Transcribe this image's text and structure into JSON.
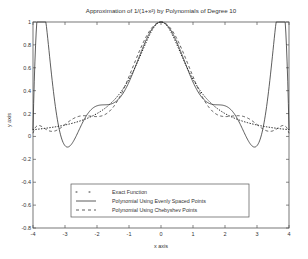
{
  "chart_data": {
    "type": "line",
    "title": "Approximation of 1/(1+x²) by Polynomials of Degree 10",
    "xlabel": "x axis",
    "ylabel": "y axis",
    "xlim": [
      -4,
      4
    ],
    "ylim": [
      -0.8,
      1
    ],
    "xticks": [
      -4,
      -3,
      -2,
      -1,
      0,
      1,
      2,
      3,
      4
    ],
    "yticks": [
      -0.8,
      -0.6,
      -0.4,
      -0.2,
      0,
      0.2,
      0.4,
      0.6,
      0.8,
      1
    ],
    "xtick_labels": [
      "-4",
      "-3",
      "-2",
      "-1",
      "0",
      "1",
      "2",
      "3",
      "4"
    ],
    "ytick_labels": [
      "-0.8",
      "-0.6",
      "-0.4",
      "-0.2",
      "0",
      "0.2",
      "0.4",
      "0.6",
      "0.8",
      "1"
    ],
    "grid": false,
    "legend_position": "lower center",
    "series": [
      {
        "name": "Exact Function",
        "style": "dotted",
        "function": "1/(1+x^2)",
        "x": [
          -4,
          -3,
          -2,
          -1,
          0,
          1,
          2,
          3,
          4
        ],
        "values": [
          0.059,
          0.1,
          0.2,
          0.5,
          1,
          0.5,
          0.2,
          0.1,
          0.059
        ]
      },
      {
        "name": "Polynomial Using Evenly Spaced Points",
        "style": "solid",
        "degree": 10,
        "x": [
          -4,
          -3.6,
          -3.2,
          -2.4,
          -1.6,
          0,
          1.6,
          2.4,
          3.2,
          3.6,
          4
        ],
        "values": [
          0.059,
          -0.6,
          0.06,
          0.14,
          0.2,
          1,
          0.2,
          0.14,
          0.06,
          -0.6,
          0.059
        ]
      },
      {
        "name": "Polynomial Using Chebyshev Points",
        "style": "dashed",
        "degree": 10,
        "x": [
          -4,
          -3,
          -2,
          -1,
          0,
          1,
          2,
          3,
          4
        ],
        "values": [
          0.059,
          0.11,
          0.19,
          0.5,
          1,
          0.5,
          0.19,
          0.11,
          0.059
        ]
      }
    ],
    "legend": [
      "Exact Function",
      "Polynomial Using Evenly Spaced Points",
      "Polynomial Using Chebyshev Points"
    ]
  }
}
